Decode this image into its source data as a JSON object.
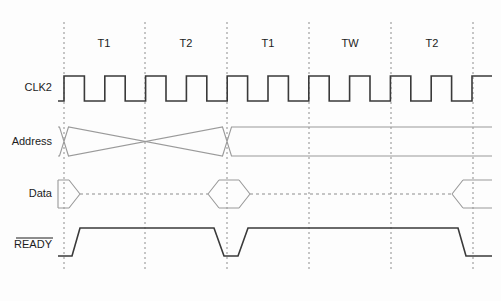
{
  "diagram": {
    "type": "timing-waveform",
    "width": 501,
    "height": 301,
    "background_color": "#fdfdfd",
    "strong_stroke_color": "#3a3a3a",
    "light_stroke_color": "#9a9a9a",
    "grid_color": "#8d8d8d"
  },
  "signals": [
    {
      "key": "clk2",
      "label": "CLK2",
      "label_x": 52,
      "label_y": 88,
      "overline": false
    },
    {
      "key": "address",
      "label": "Address",
      "label_x": 52,
      "label_y": 142,
      "overline": false
    },
    {
      "key": "data",
      "label": "Data",
      "label_x": 52,
      "label_y": 194,
      "overline": false
    },
    {
      "key": "ready",
      "label": "READY",
      "label_x": 52,
      "label_y": 245,
      "overline": true
    }
  ],
  "state_labels": [
    {
      "text": "T1",
      "x": 104,
      "y": 44
    },
    {
      "text": "T2",
      "x": 186,
      "y": 44
    },
    {
      "text": "T1",
      "x": 268,
      "y": 44
    },
    {
      "text": "TW",
      "x": 350,
      "y": 44
    },
    {
      "text": "T2",
      "x": 432,
      "y": 44
    }
  ],
  "grid_lines": {
    "x_positions": [
      64,
      145,
      227,
      309,
      391,
      473
    ],
    "y_top": 22,
    "y_bottom": 272
  },
  "clock": {
    "y_high": 76,
    "y_low": 101,
    "x_start": 58,
    "x_end": 492,
    "half_period": 20.4,
    "first_rise_x": 64,
    "pulses_per_state": 2,
    "total_states": 5
  },
  "address_bus": {
    "y_high": 127,
    "y_low": 156,
    "x_start": 58,
    "x_end": 492,
    "transition_xs": [
      64,
      227
    ],
    "skew": 9
  },
  "data_bus": {
    "y_high": 180,
    "y_low": 208,
    "y_mid": 194,
    "x_start": 58,
    "x_end": 492,
    "valid_windows": [
      {
        "start": 58,
        "end": 80
      },
      {
        "start": 208,
        "end": 250
      },
      {
        "start": 452,
        "end": 492
      }
    ],
    "skew": 11
  },
  "ready": {
    "y_high": 228,
    "y_low": 256,
    "x_start": 58,
    "x_end": 492,
    "segments": [
      {
        "state": "low",
        "from": 58,
        "to": 72
      },
      {
        "state": "high",
        "from": 80,
        "to": 214
      },
      {
        "state": "low",
        "from": 224,
        "to": 238
      },
      {
        "state": "high",
        "from": 248,
        "to": 458
      },
      {
        "state": "low",
        "from": 466,
        "to": 492
      }
    ],
    "edge_slope": 8
  }
}
